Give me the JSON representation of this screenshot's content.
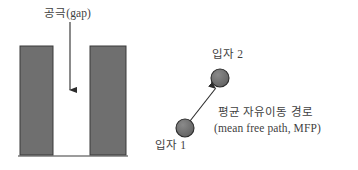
{
  "figure": {
    "background_color": "#ffffff",
    "width": 358,
    "height": 170
  },
  "colors": {
    "fill_gray": "#6f6f6f",
    "stroke_dark": "#2b2b2b",
    "text": "#3f3f3f",
    "background": "#ffffff"
  },
  "left_diagram": {
    "name": "gap-illustration",
    "gap_label": "공극(gap)",
    "arrow": {
      "name": "gap-arrow",
      "direction": "down",
      "x": 70,
      "y_start": 22,
      "y_end": 97
    },
    "blocks": [
      {
        "name": "left-block",
        "x": 20,
        "y": 46,
        "width": 33,
        "height": 109,
        "fill": "#6f6f6f"
      },
      {
        "name": "right-block",
        "x": 90,
        "y": 46,
        "width": 36,
        "height": 109,
        "fill": "#6f6f6f"
      }
    ],
    "baseline": {
      "name": "base-line",
      "x_start": 18,
      "x_end": 128,
      "y": 156
    },
    "gap_region": {
      "x_start": 53,
      "x_end": 90,
      "width": 37
    }
  },
  "right_diagram": {
    "name": "mean-free-path-illustration",
    "particles": [
      {
        "name": "particle-1",
        "label": "입자 1",
        "cx": 185,
        "cy": 128,
        "r": 9,
        "fill": "#6f6f6f"
      },
      {
        "name": "particle-2",
        "label": "입자 2",
        "cx": 220,
        "cy": 78,
        "r": 9,
        "fill": "#6f6f6f"
      }
    ],
    "path_arrow": {
      "name": "mfp-arrow",
      "from": "particle-1",
      "to": "particle-2",
      "x1": 190,
      "y1": 121,
      "x2": 214,
      "y2": 86
    },
    "mfp_label_korean": "평균 자유이동 경로",
    "mfp_label_english": "(mean free path, MFP)"
  }
}
